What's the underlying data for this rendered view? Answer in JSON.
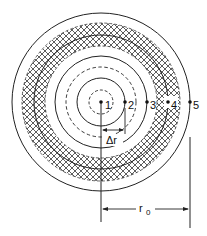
{
  "diagram": {
    "center": {
      "x": 101,
      "y": 102
    },
    "colors": {
      "stroke": "#222222",
      "background": "#ffffff",
      "hatch": "#333333"
    },
    "circles": [
      {
        "r": 12,
        "style": "dashed"
      },
      {
        "r": 24,
        "style": "solid"
      },
      {
        "r": 35,
        "style": "dashed"
      },
      {
        "r": 46,
        "style": "solid"
      },
      {
        "r": 61,
        "style": "dashed-hatched-inner"
      },
      {
        "r": 68,
        "style": "solid"
      },
      {
        "r": 79,
        "style": "dashed-hatched-outer"
      },
      {
        "r": 89,
        "style": "solid"
      }
    ],
    "hatched_band": {
      "inner_r": 56,
      "outer_r": 79
    },
    "nodes": [
      {
        "id": "1",
        "label": "1",
        "x": 101,
        "y": 102
      },
      {
        "id": "2",
        "label": "2",
        "x": 125,
        "y": 102
      },
      {
        "id": "3",
        "label": "3",
        "x": 147,
        "y": 102
      },
      {
        "id": "4",
        "label": "4",
        "x": 168,
        "y": 102
      },
      {
        "id": "5",
        "label": "5",
        "x": 190,
        "y": 102
      }
    ],
    "dimensions": {
      "delta_r": {
        "label": "Δr",
        "from_x": 101,
        "to_x": 125,
        "y": 130
      },
      "r0": {
        "label": "r",
        "subscript": "0",
        "from_x": 101,
        "to_x": 190,
        "y": 209
      }
    }
  }
}
